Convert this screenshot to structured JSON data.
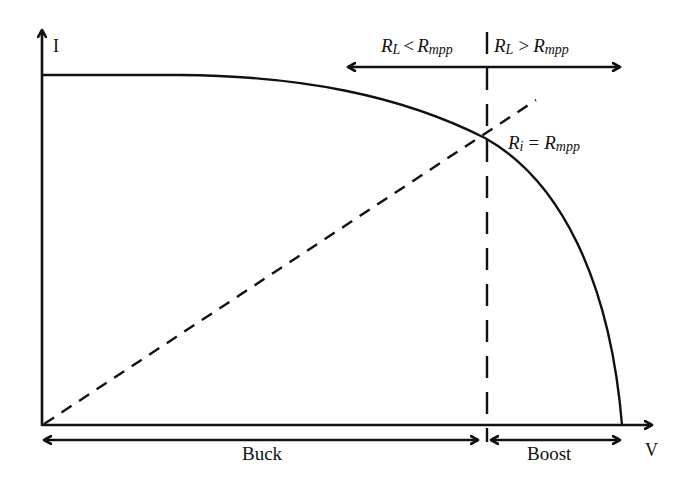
{
  "diagram": {
    "type": "pv-iv-curve-converter-regions",
    "axes": {
      "y_label": "I",
      "x_label": "V"
    },
    "top_region_labels": {
      "left": {
        "R": "R",
        "sub1": "L",
        "op": "<",
        "R2": "R",
        "sub2": "mpp"
      },
      "right": {
        "R": "R",
        "sub1": "L",
        "op": ">",
        "R2": "R",
        "sub2": "mpp"
      }
    },
    "mpp_label": {
      "R": "R",
      "sub1": "i",
      "op": "=",
      "R2": "R",
      "sub2": "mpp"
    },
    "bottom_regions": {
      "buck": "Buck",
      "boost": "Boost"
    },
    "colors": {
      "stroke": "#111111",
      "background": "#ffffff"
    }
  }
}
